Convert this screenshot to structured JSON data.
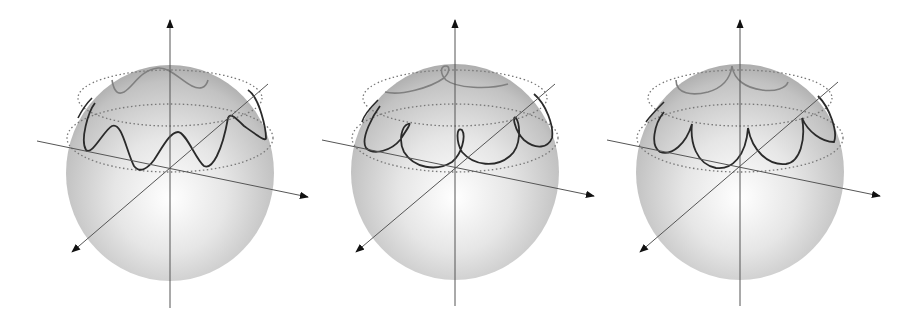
{
  "figure": {
    "panel_count": 3,
    "background": "#ffffff",
    "sphere_fill_light": "#ffffff",
    "sphere_fill_dark": "#a9a9a9",
    "curve_color_front": "#2a2a2a",
    "curve_color_back": "#7a7a7a",
    "axis_color": "#555555",
    "latitude_circle_style": "dotted",
    "panels": [
      {
        "id": "panel-1",
        "curve_type": "wavy",
        "lobes_visible": 5,
        "description": "undulating nutation curve between two latitude circles"
      },
      {
        "id": "panel-2",
        "curve_type": "looped",
        "lobes_visible": 5,
        "description": "looping nutation curve between two latitude circles"
      },
      {
        "id": "panel-3",
        "curve_type": "cusped",
        "lobes_visible": 5,
        "description": "cusped nutation curve touching upper latitude circle"
      }
    ]
  }
}
